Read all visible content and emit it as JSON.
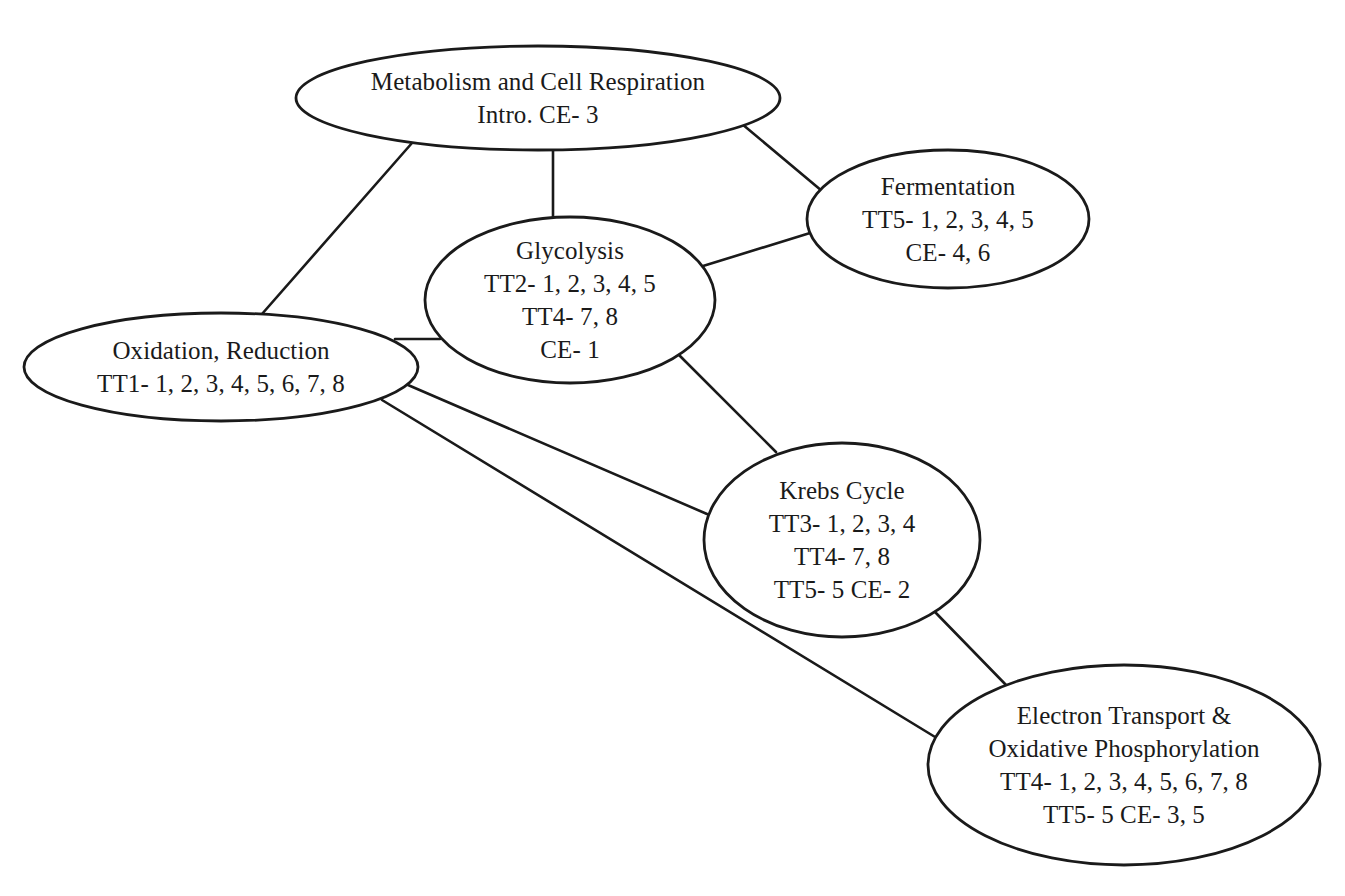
{
  "diagram": {
    "type": "concept-map",
    "colors": {
      "stroke": "#1a1a1a",
      "background": "#ffffff",
      "text": "#1a1a1a"
    },
    "nodes": [
      {
        "id": "metabolism",
        "lines": [
          "Metabolism and Cell Respiration",
          "Intro. CE- 3"
        ],
        "cx": 538,
        "cy": 98,
        "rx": 242,
        "ry": 52
      },
      {
        "id": "fermentation",
        "lines": [
          "Fermentation",
          "TT5- 1, 2, 3, 4, 5",
          "CE- 4, 6"
        ],
        "cx": 948,
        "cy": 219,
        "rx": 141,
        "ry": 69
      },
      {
        "id": "glycolysis",
        "lines": [
          "Glycolysis",
          "TT2- 1, 2, 3, 4, 5",
          "TT4- 7, 8",
          "CE- 1"
        ],
        "cx": 570,
        "cy": 300,
        "rx": 145,
        "ry": 83
      },
      {
        "id": "oxidation-reduction",
        "lines": [
          "Oxidation, Reduction",
          "TT1- 1, 2, 3, 4, 5, 6, 7, 8"
        ],
        "cx": 221,
        "cy": 367,
        "rx": 197,
        "ry": 54
      },
      {
        "id": "krebs-cycle",
        "lines": [
          "Krebs Cycle",
          "TT3- 1, 2, 3, 4",
          "TT4- 7, 8",
          "TT5- 5 CE- 2"
        ],
        "cx": 842,
        "cy": 540,
        "rx": 138,
        "ry": 97
      },
      {
        "id": "electron-transport",
        "lines": [
          "Electron Transport &",
          "Oxidative Phosphorylation",
          "TT4- 1, 2, 3, 4, 5, 6, 7, 8",
          "TT5- 5 CE- 3, 5"
        ],
        "cx": 1124,
        "cy": 765,
        "rx": 196,
        "ry": 100
      }
    ],
    "edges": [
      {
        "from": "metabolism",
        "to": "oxidation-reduction",
        "x1": 412,
        "y1": 143,
        "x2": 262,
        "y2": 314
      },
      {
        "from": "metabolism",
        "to": "glycolysis",
        "x1": 553,
        "y1": 150,
        "x2": 553,
        "y2": 218
      },
      {
        "from": "metabolism",
        "to": "fermentation",
        "x1": 742,
        "y1": 124,
        "x2": 822,
        "y2": 191
      },
      {
        "from": "glycolysis",
        "to": "fermentation",
        "x1": 703,
        "y1": 266,
        "x2": 810,
        "y2": 233
      },
      {
        "from": "oxidation-reduction",
        "to": "glycolysis",
        "x1": 395,
        "y1": 339,
        "x2": 440,
        "y2": 339
      },
      {
        "from": "glycolysis",
        "to": "krebs-cycle",
        "x1": 678,
        "y1": 354,
        "x2": 776,
        "y2": 452
      },
      {
        "from": "oxidation-reduction",
        "to": "krebs-cycle",
        "x1": 408,
        "y1": 385,
        "x2": 707,
        "y2": 514
      },
      {
        "from": "oxidation-reduction",
        "to": "electron-transport",
        "x1": 382,
        "y1": 400,
        "x2": 940,
        "y2": 740
      },
      {
        "from": "krebs-cycle",
        "to": "electron-transport",
        "x1": 935,
        "y1": 612,
        "x2": 1007,
        "y2": 686
      }
    ]
  }
}
